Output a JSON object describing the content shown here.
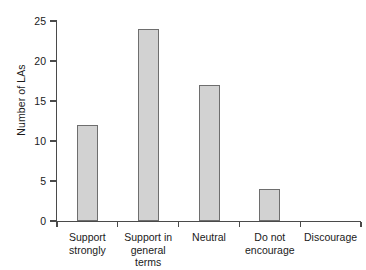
{
  "chart_data": {
    "type": "bar",
    "title": "",
    "xlabel": "",
    "ylabel": "Number of LAs",
    "categories": [
      "Support\nstrongly",
      "Support in\ngeneral terms",
      "Neutral",
      "Do not\nencourage",
      "Discourage"
    ],
    "values": [
      12,
      24,
      17,
      4,
      0
    ],
    "ylim": [
      0,
      25
    ],
    "ytick_labels": [
      "0",
      "5",
      "10",
      "15",
      "20",
      "25"
    ],
    "ytick_values": [
      0,
      5,
      10,
      15,
      20,
      25
    ],
    "grid": false,
    "legend": false,
    "bar_fill_color": "#d2d2d2",
    "bar_edge_color": "#6e6e6e",
    "axis_color": "#4a4a4a",
    "background_color": "#ffffff"
  }
}
